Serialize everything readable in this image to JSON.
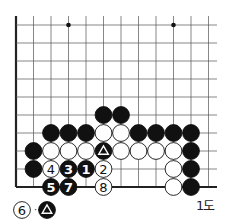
{
  "diagram": {
    "caption": "1도",
    "board": {
      "cols": 12,
      "rows": 10,
      "origin_x": 16,
      "origin_y": 25,
      "spacing_x": 17.5,
      "spacing_y": 18,
      "top_extent": 16,
      "right_extent": 217,
      "edges": {
        "left": true,
        "bottom": true,
        "top": false,
        "right": false
      },
      "star_points": [
        [
          3,
          0
        ],
        [
          9,
          0
        ]
      ]
    },
    "stones": [
      {
        "col": 5,
        "row": 5,
        "color": "black"
      },
      {
        "col": 6,
        "row": 5,
        "color": "black"
      },
      {
        "col": 2,
        "row": 6,
        "color": "black"
      },
      {
        "col": 3,
        "row": 6,
        "color": "black"
      },
      {
        "col": 4,
        "row": 6,
        "color": "black"
      },
      {
        "col": 5,
        "row": 6,
        "color": "white"
      },
      {
        "col": 6,
        "row": 6,
        "color": "white"
      },
      {
        "col": 7,
        "row": 6,
        "color": "black"
      },
      {
        "col": 8,
        "row": 6,
        "color": "black"
      },
      {
        "col": 9,
        "row": 6,
        "color": "black"
      },
      {
        "col": 10,
        "row": 6,
        "color": "black"
      },
      {
        "col": 1,
        "row": 7,
        "color": "black"
      },
      {
        "col": 2,
        "row": 7,
        "color": "white"
      },
      {
        "col": 3,
        "row": 7,
        "color": "white"
      },
      {
        "col": 4,
        "row": 7,
        "color": "white"
      },
      {
        "col": 5,
        "row": 7,
        "color": "black",
        "mark": "triangle"
      },
      {
        "col": 6,
        "row": 7,
        "color": "white"
      },
      {
        "col": 7,
        "row": 7,
        "color": "white"
      },
      {
        "col": 8,
        "row": 7,
        "color": "white"
      },
      {
        "col": 9,
        "row": 7,
        "color": "white"
      },
      {
        "col": 10,
        "row": 7,
        "color": "black"
      },
      {
        "col": 1,
        "row": 8,
        "color": "black"
      },
      {
        "col": 2,
        "row": 8,
        "color": "white",
        "label": "4"
      },
      {
        "col": 3,
        "row": 8,
        "color": "black",
        "label": "3"
      },
      {
        "col": 4,
        "row": 8,
        "color": "black",
        "label": "1"
      },
      {
        "col": 5,
        "row": 8,
        "color": "white",
        "label": "2"
      },
      {
        "col": 9,
        "row": 8,
        "color": "white"
      },
      {
        "col": 10,
        "row": 8,
        "color": "black"
      },
      {
        "col": 2,
        "row": 9,
        "color": "black",
        "label": "5"
      },
      {
        "col": 3,
        "row": 9,
        "color": "black",
        "label": "7"
      },
      {
        "col": 5,
        "row": 9,
        "color": "white",
        "label": "8"
      },
      {
        "col": 9,
        "row": 9,
        "color": "white"
      },
      {
        "col": 10,
        "row": 9,
        "color": "black"
      }
    ],
    "notes": [
      {
        "move_label": "6",
        "move_color": "white",
        "separator": "···",
        "at_color": "black",
        "at_mark": "triangle"
      }
    ],
    "colors": {
      "black_stone": "#111111",
      "white_stone": "#ffffff",
      "line": "#555555",
      "edge": "#222222"
    }
  }
}
